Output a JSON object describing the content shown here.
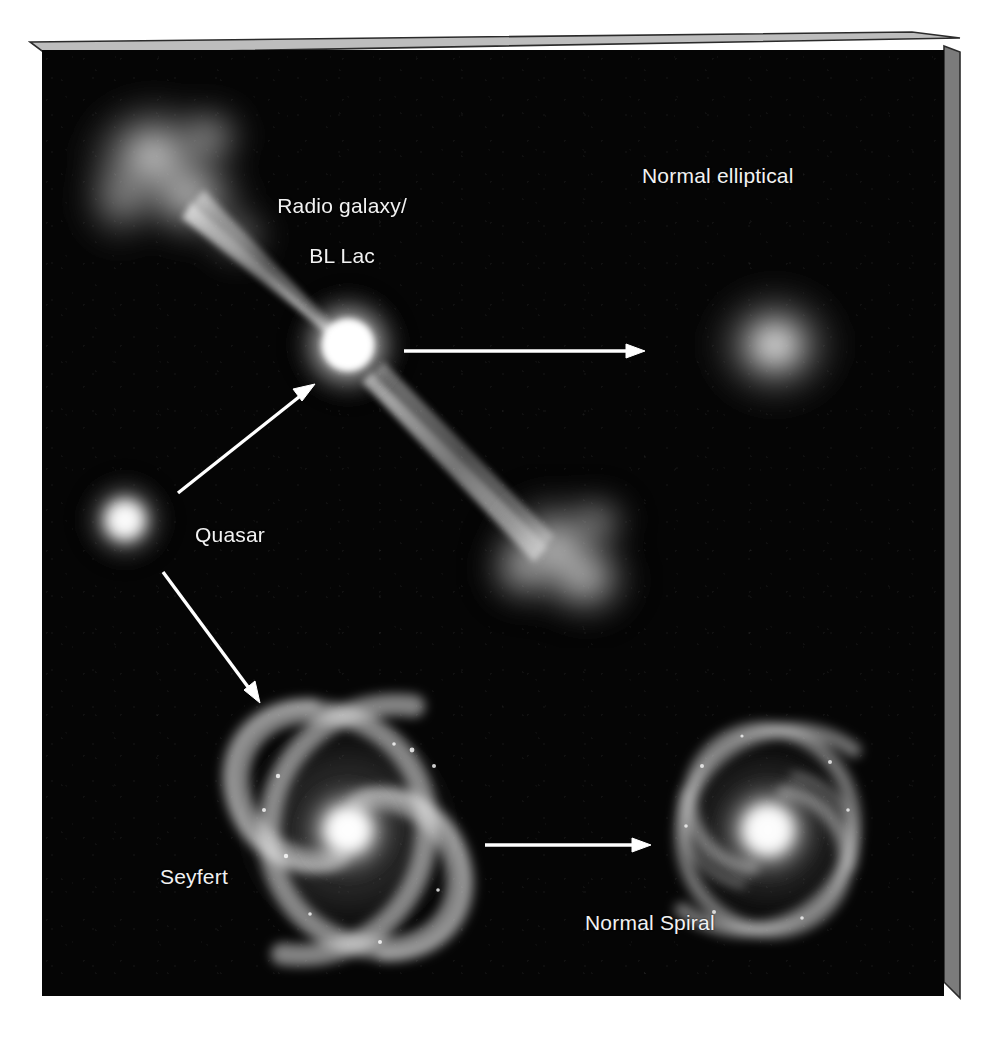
{
  "figure": {
    "type": "astronomy-schematic",
    "title_visible": false,
    "background_color": "#050505",
    "label_color": "#f2f2f2",
    "frame": {
      "style": "3d-slab",
      "top_bevel_color": "#b8b8b8",
      "side_face_color": "#787878",
      "page_background": "#ffffff"
    }
  },
  "labels": {
    "radio_galaxy_line1": "Radio galaxy/",
    "radio_galaxy_line2": "BL Lac",
    "normal_elliptical": "Normal elliptical",
    "quasar": "Quasar",
    "seyfert": "Seyfert",
    "normal_spiral": "Normal Spiral"
  },
  "objects": [
    {
      "name": "radio-lobe-upper-left",
      "kind": "radio-lobe",
      "cx": 150,
      "cy": 150
    },
    {
      "name": "radio-jet",
      "kind": "jet",
      "from": [
        175,
        175
      ],
      "to": [
        530,
        525
      ]
    },
    {
      "name": "quasar-core",
      "kind": "point-source",
      "cx": 348,
      "cy": 345
    },
    {
      "name": "radio-lobe-lower-right",
      "kind": "radio-lobe",
      "cx": 555,
      "cy": 550
    },
    {
      "name": "normal-elliptical-galaxy",
      "kind": "elliptical",
      "cx": 775,
      "cy": 345
    },
    {
      "name": "quasar-point-source",
      "kind": "point-source",
      "cx": 125,
      "cy": 520
    },
    {
      "name": "seyfert-spiral-galaxy",
      "kind": "spiral",
      "cx": 348,
      "cy": 830
    },
    {
      "name": "normal-spiral-galaxy",
      "kind": "spiral",
      "cx": 768,
      "cy": 830
    }
  ],
  "arrows": [
    {
      "name": "arrow-quasar-to-elliptical",
      "from": [
        404,
        351
      ],
      "to": [
        645,
        351
      ],
      "direction": "right"
    },
    {
      "name": "arrow-quasar-to-core",
      "from": [
        178,
        493
      ],
      "to": [
        313,
        385
      ],
      "direction": "up-right"
    },
    {
      "name": "arrow-quasar-to-seyfert",
      "from": [
        163,
        572
      ],
      "to": [
        258,
        700
      ],
      "direction": "down-right"
    },
    {
      "name": "arrow-seyfert-to-normal-spiral",
      "from": [
        485,
        845
      ],
      "to": [
        650,
        845
      ],
      "direction": "right"
    }
  ]
}
